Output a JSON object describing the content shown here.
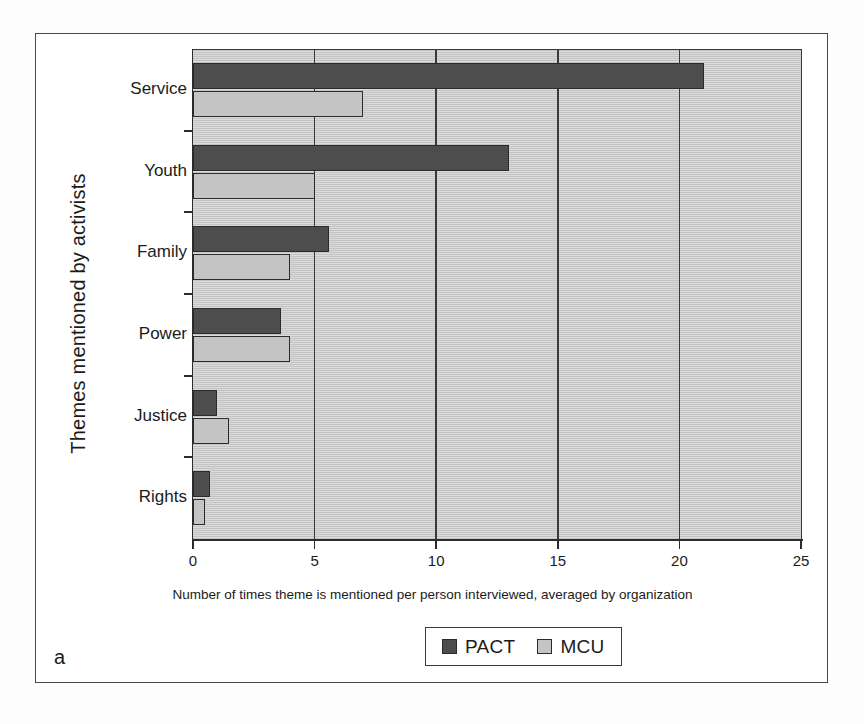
{
  "figure": {
    "panel_letter": "a"
  },
  "chart_data": {
    "type": "bar",
    "orientation": "horizontal",
    "title": "",
    "xlabel": "Number of times theme is mentioned per person interviewed, averaged by organization",
    "ylabel": "Themes mentioned by activists",
    "categories": [
      "Service",
      "Youth",
      "Family",
      "Power",
      "Justice",
      "Rights"
    ],
    "series": [
      {
        "name": "PACT",
        "color": "#4d4d4d",
        "values": [
          21,
          13,
          5.6,
          3.6,
          1.0,
          0.7
        ]
      },
      {
        "name": "MCU",
        "color": "#c4c4c4",
        "values": [
          7,
          5,
          4.0,
          4.0,
          1.5,
          0.5
        ]
      }
    ],
    "xlim": [
      0,
      25
    ],
    "xticks": [
      0,
      5,
      10,
      15,
      20,
      25
    ],
    "xtick_labels": [
      "0",
      "5",
      "10",
      "15",
      "20",
      "25"
    ],
    "grid": "vertical",
    "legend_position": "bottom-center",
    "plot_background": "#c9c9c9",
    "axis_color": "#2b2b2b"
  }
}
